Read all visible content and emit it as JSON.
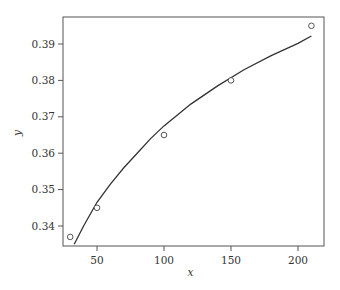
{
  "chart_data": {
    "type": "scatter",
    "title": "",
    "xlabel": "x",
    "ylabel": "y",
    "xlim": [
      25,
      220
    ],
    "ylim": [
      0.335,
      0.3965
    ],
    "xticks": [
      50,
      100,
      150,
      200
    ],
    "xtick_labels": [
      "50",
      "100",
      "150",
      "200"
    ],
    "yticks": [
      0.34,
      0.35,
      0.36,
      0.37,
      0.38,
      0.39
    ],
    "ytick_labels": [
      "0.34",
      "0.35",
      "0.36",
      "0.37",
      "0.38",
      "0.39"
    ],
    "grid": false,
    "legend": null,
    "series": [
      {
        "name": "observed",
        "type": "scatter",
        "marker": "open-circle",
        "x": [
          30,
          50,
          100,
          150,
          210
        ],
        "y": [
          0.337,
          0.345,
          0.365,
          0.38,
          0.395
        ]
      },
      {
        "name": "fitted curve",
        "type": "line",
        "x": [
          33,
          40,
          50,
          60,
          70,
          80,
          90,
          100,
          120,
          140,
          160,
          180,
          200,
          210
        ],
        "y": [
          0.335,
          0.34,
          0.3465,
          0.3515,
          0.356,
          0.36,
          0.364,
          0.3675,
          0.3735,
          0.3785,
          0.383,
          0.3868,
          0.3902,
          0.3922
        ]
      }
    ]
  }
}
